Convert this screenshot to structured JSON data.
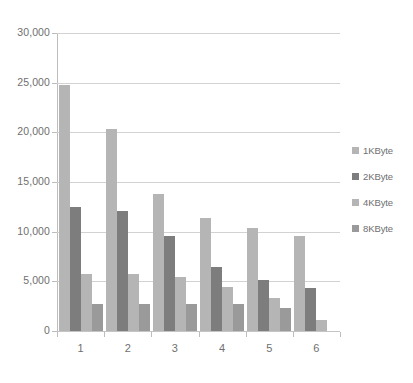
{
  "chart_data": {
    "type": "bar",
    "title": "",
    "subtitle": "",
    "xlabel": "",
    "ylabel": "",
    "categories": [
      "1",
      "2",
      "3",
      "4",
      "5",
      "6"
    ],
    "series": [
      {
        "name": "1KByte",
        "color": "#b5b5b5",
        "values": [
          24800,
          20300,
          13800,
          11400,
          10400,
          9600
        ]
      },
      {
        "name": "2KByte",
        "color": "#7d7d7d",
        "values": [
          12450,
          12100,
          9600,
          6400,
          5100,
          4300
        ]
      },
      {
        "name": "4KByte",
        "color": "#b5b5b5",
        "values": [
          5700,
          5700,
          5400,
          4400,
          3300,
          1150
        ]
      },
      {
        "name": "8KByte",
        "color": "#9a9a9a",
        "values": [
          2700,
          2750,
          2750,
          2700,
          2300,
          0
        ]
      }
    ],
    "ylim": [
      0,
      30000
    ],
    "ytick_values": [
      0,
      5000,
      10000,
      15000,
      20000,
      25000,
      30000
    ],
    "ytick_labels": [
      "0",
      "5,000",
      "10,000",
      "15,000",
      "20,000",
      "25,000",
      "30,000"
    ],
    "grid": true,
    "grid_axis": "y",
    "legend_position": "right",
    "legend_entries": [
      "1KByte",
      "2KByte",
      "4KByte",
      "8KByte"
    ],
    "background_color": "#ffffff",
    "gridline_color": "#d2d2d2",
    "axis_color": "#bdbdbd",
    "tick_label_color": "#6f6f6f"
  }
}
